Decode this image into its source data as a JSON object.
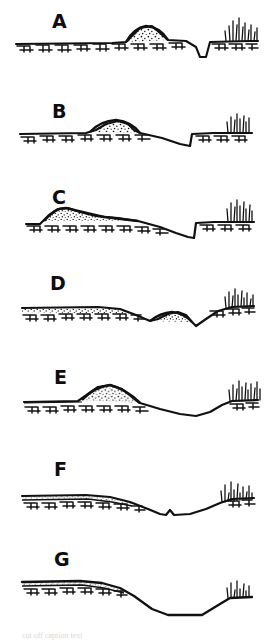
{
  "figure": {
    "background_color": "#ffffff",
    "ink_color": "#111111",
    "stipple_color": "#1a1a1a",
    "panel_count": 7,
    "caption_fragment": "cut off caption text"
  },
  "panels": [
    {
      "id": "A",
      "label": "A",
      "description": "Flat hatched ground surface with a small rounded stippled mound near centre-right and a narrow sharp V-notch depression to its right, rising to a grassy terrace at far right.",
      "mound": "small rounded stippled mound",
      "depression": "narrow sharp notch",
      "grass": "dense tuft at right terrace"
    },
    {
      "id": "B",
      "label": "B",
      "description": "Hatched ground with a broad rounded stippled mound left of centre; surface slopes down to a wide shallow basin, then steps abruptly up to a grassy terrace at right.",
      "mound": "broad rounded stippled mound",
      "depression": "wide shallow basin with vertical right step",
      "grass": "tuft at right terrace"
    },
    {
      "id": "C",
      "label": "C",
      "description": "Hatched ground with a low asymmetric stippled ridge at left tapering right; long gentle slope into a broad basin, then a vertical step up to a grassy terrace.",
      "mound": "low asymmetric stippled ridge at left",
      "depression": "broad basin with vertical right step",
      "grass": "tall tuft at right terrace"
    },
    {
      "id": "D",
      "label": "D",
      "description": "Thin stippled layer over hatched ground at left; surface dips and a small stippled lens sits mid-right, followed by a shallow trough rising to a grassy terrace.",
      "mound": "small stippled lens at mid-right",
      "depression": "shallow trough",
      "grass": "tuft at right terrace"
    },
    {
      "id": "E",
      "label": "E",
      "description": "Hatched ground with a prominent stippled mound left of centre; long smooth slope down to a wide flat-bottomed basin, then up to a grassy terrace.",
      "mound": "prominent stippled mound",
      "depression": "wide flat-bottomed basin",
      "grass": "dense tuft at right terrace"
    },
    {
      "id": "F",
      "label": "F",
      "description": "Thin continuous stippled layer capping hatched ground across the left; gentle slope into a basin with a small central notch, rising to a grassy terrace at right.",
      "mound": "thin stippled cap layer (no mound)",
      "depression": "basin with small central notch",
      "grass": "tuft at right terrace"
    },
    {
      "id": "G",
      "label": "G",
      "description": "Thin stippled layer over hatched ground at left; surface descends in a straight ramp to a broad flat floor, then climbs to a small grassy ledge at right.",
      "mound": "thin stippled cap layer (no mound)",
      "depression": "broad flat-floored trough",
      "grass": "small tuft at right ledge"
    }
  ]
}
